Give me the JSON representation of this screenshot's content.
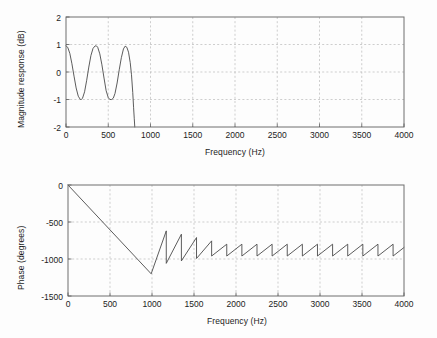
{
  "figure": {
    "background_color": "#fdfdfd",
    "line_color": "#4a4a4a",
    "grid_color": "#b9b9b9",
    "axis_color": "#6e6e6e"
  },
  "chart_data": [
    {
      "type": "line",
      "name": "magnitude-response",
      "title": "",
      "xlabel": "Frequency (Hz)",
      "ylabel": "Magnitude response (dB)",
      "xlim": [
        0,
        4000
      ],
      "ylim": [
        -2,
        2
      ],
      "xticks": [
        0,
        500,
        1000,
        1500,
        2000,
        2500,
        3000,
        3500,
        4000
      ],
      "xticklabels": [
        "0",
        "500",
        "1000",
        "1500",
        "2000",
        "2500",
        "3000",
        "3500",
        "4000"
      ],
      "yticks": [
        -2,
        -1,
        0,
        1,
        2
      ],
      "yticklabels": [
        "-2",
        "-1",
        "0",
        "1",
        "2"
      ],
      "grid": true,
      "legend": null,
      "series": [
        {
          "name": "magnitude",
          "x": [
            0,
            20,
            45,
            70,
            95,
            120,
            145,
            170,
            180,
            195,
            220,
            245,
            270,
            295,
            320,
            345,
            360,
            375,
            400,
            425,
            450,
            475,
            500,
            520,
            540,
            560,
            580,
            605,
            630,
            655,
            680,
            700,
            720,
            740,
            760,
            775,
            790,
            800,
            808,
            814
          ],
          "y": [
            0.95,
            0.9,
            0.68,
            0.3,
            -0.15,
            -0.58,
            -0.88,
            -1.0,
            -1.0,
            -0.96,
            -0.72,
            -0.3,
            0.18,
            0.6,
            0.86,
            0.95,
            0.95,
            0.9,
            0.66,
            0.26,
            -0.22,
            -0.68,
            -0.93,
            -1.0,
            -1.0,
            -0.95,
            -0.78,
            -0.4,
            0.08,
            0.52,
            0.84,
            0.94,
            0.9,
            0.72,
            0.34,
            -0.1,
            -0.75,
            -1.3,
            -1.7,
            -2.0
          ]
        }
      ]
    },
    {
      "type": "line",
      "name": "phase-response",
      "title": "",
      "xlabel": "Frequency (Hz)",
      "ylabel": "Phase (degrees)",
      "xlim": [
        0,
        4000
      ],
      "ylim": [
        -1500,
        0
      ],
      "xticks": [
        0,
        500,
        1000,
        1500,
        2000,
        2500,
        3000,
        3500,
        4000
      ],
      "xticklabels": [
        "0",
        "500",
        "1000",
        "1500",
        "2000",
        "2500",
        "3000",
        "3500",
        "4000"
      ],
      "yticks": [
        -1500,
        -1000,
        -500,
        0
      ],
      "yticklabels": [
        "-1500",
        "-1000",
        "-500",
        "0"
      ],
      "grid": true,
      "legend": null,
      "series": [
        {
          "name": "phase",
          "description": "Linear phase ramp from 0 deg at 0 Hz to -1200 deg at 990 Hz, then a rising sawtooth with ~180 Hz period whose amplitude grows over the first few teeth and settles with peaks near -800 deg and troughs near -960 deg.",
          "ramp": {
            "x_start": 0,
            "y_start": 0,
            "x_end": 990,
            "y_end": -1200
          },
          "sawtooth": {
            "x_start": 990,
            "x_end": 4000,
            "period": 180,
            "settled_peak": -800,
            "settled_trough": -960,
            "first_trough": -1200
          }
        }
      ]
    }
  ]
}
